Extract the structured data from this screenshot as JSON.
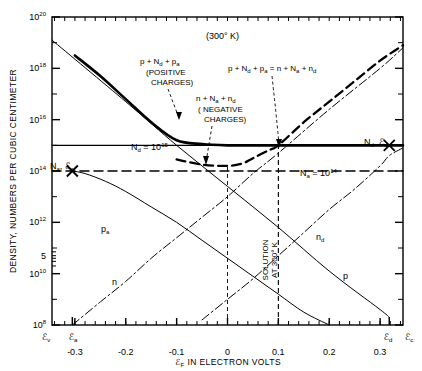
{
  "figure": {
    "temperature_label": "(300° K)",
    "y_axis_title": "DENSITY, NUMBERS PER CUBIC CENTIMETER",
    "x_axis_title_prefix": "ℰ",
    "x_axis_title_sub": "F",
    "x_axis_title_rest": " IN ELECTRON VOLTS"
  },
  "annotations": {
    "positive": {
      "line1": "p + N",
      "line1_sub": "d",
      "line1_rest": " + p",
      "line1_sub2": "a",
      "line2": "(POSITIVE",
      "line3": "CHARGES)"
    },
    "negative": {
      "line1": "n + N",
      "line1_sub": "a",
      "line1_rest": " + n",
      "line1_sub2": "d",
      "line2": "( NEGATIVE",
      "line3": "CHARGES)"
    },
    "balance_equation": "p + Nₙ + pₐ = n + Nₐ + nₑ",
    "solution_line1": "SOLUTION",
    "solution_line2": "AT 300° K",
    "nd_level_label": "N",
    "nd_level_sub": "d",
    "nd_level_value": " = 10",
    "nd_level_exp": "15",
    "na_level_label": "N",
    "na_level_sub": "a",
    "na_level_value": " = 10",
    "na_level_exp": "14",
    "na_marker": "N",
    "na_marker_sub": "a",
    "na_marker_rest": ", ℰ",
    "na_marker_sub2": "a",
    "nd_marker": "N",
    "nd_marker_sub": "d",
    "nd_marker_rest": ", ℰ",
    "nd_marker_sub2": "d"
  },
  "curve_labels": {
    "pa": "p",
    "pa_sub": "a",
    "n": "n",
    "nd": "n",
    "nd_sub": "d",
    "p": "p"
  },
  "band_edges": {
    "ev": "ℰ",
    "ev_sub": "v",
    "ea": "ℰ",
    "ea_sub": "a",
    "ed": "ℰ",
    "ed_sub": "d",
    "ec": "ℰ",
    "ec_sub": "c"
  },
  "chart_data": {
    "type": "line",
    "title": "(300° K)",
    "xlabel": "ℰF IN ELECTRON VOLTS",
    "ylabel": "DENSITY, NUMBERS PER CUBIC CENTIMETER",
    "xlim": [
      -0.345,
      0.345
    ],
    "ylim_log10": [
      8,
      20
    ],
    "grid": false,
    "legend": "inline-curve-labels",
    "x_ticks": [
      -0.3,
      -0.2,
      -0.1,
      0,
      0.1,
      0.2,
      0.3
    ],
    "x_tick_labels": [
      "-0.3",
      "-0.2",
      "-0.1",
      "0",
      "0.1",
      "0.2",
      "0.3"
    ],
    "x_minor_step": 0.02,
    "y_ticks_log10": [
      8,
      10,
      12,
      14,
      16,
      18,
      20
    ],
    "y_tick_labels": [
      "10",
      "10",
      "10",
      "10",
      "10",
      "10",
      "10"
    ],
    "y_tick_exponents": [
      "8",
      "10",
      "12",
      "14",
      "16",
      "18",
      "20"
    ],
    "y_extra_tick_label": "5",
    "y_extra_tick_log10": 10.7,
    "band_edge_positions": {
      "ev": -0.345,
      "ea": -0.305,
      "ed": 0.318,
      "ec": 0.345
    },
    "markers": [
      {
        "name": "Na,Ea",
        "x": -0.305,
        "y_log10": 14.0,
        "symbol": "X"
      },
      {
        "name": "Nd,Ed",
        "x": 0.318,
        "y_log10": 15.0,
        "symbol": "X"
      }
    ],
    "solution_x": 0.1,
    "solution_y_log10": 15.0,
    "series": [
      {
        "name": "Nd = 1e15",
        "style": "solid-thin-horizontal",
        "y_log10": 15.0,
        "x": [
          -0.345,
          0.345
        ],
        "values_log10": [
          15.0,
          15.0
        ]
      },
      {
        "name": "Na = 1e14",
        "style": "dashed-horizontal",
        "y_log10": 14.0,
        "x": [
          -0.345,
          0.345
        ],
        "values_log10": [
          14.0,
          14.0
        ]
      },
      {
        "name": "p",
        "style": "solid-thin",
        "x": [
          -0.345,
          -0.2,
          -0.1,
          0,
          0.1,
          0.2,
          0.3,
          0.318
        ],
        "values_log10": [
          19.1,
          16.7,
          15.0,
          13.4,
          11.8,
          10.1,
          8.6,
          8.3
        ]
      },
      {
        "name": "p_a",
        "style": "solid-thin",
        "x": [
          -0.305,
          -0.28,
          -0.24,
          -0.2,
          -0.15,
          -0.1,
          -0.05,
          0,
          0.05,
          0.1,
          0.15,
          0.2
        ],
        "values_log10": [
          14.0,
          13.9,
          13.6,
          13.2,
          12.6,
          12.0,
          11.3,
          10.6,
          9.9,
          9.2,
          8.5,
          8.0
        ]
      },
      {
        "name": "n",
        "style": "dash-dot",
        "x": [
          -0.305,
          -0.25,
          -0.2,
          -0.15,
          -0.1,
          -0.05,
          0,
          0.05,
          0.1,
          0.2,
          0.3,
          0.345
        ],
        "values_log10": [
          8.0,
          8.9,
          9.7,
          10.6,
          11.4,
          12.2,
          13.0,
          13.9,
          14.7,
          16.4,
          18.0,
          18.8
        ]
      },
      {
        "name": "n_d",
        "style": "dash-dot",
        "x": [
          -0.05,
          0,
          0.05,
          0.1,
          0.15,
          0.2,
          0.25,
          0.3,
          0.318,
          0.345
        ],
        "values_log10": [
          8.2,
          9.0,
          9.8,
          10.7,
          11.6,
          12.5,
          13.3,
          14.2,
          14.6,
          14.9
        ]
      },
      {
        "name": "positive-charges-sum",
        "style": "solid-thick",
        "x": [
          -0.3,
          -0.25,
          -0.2,
          -0.15,
          -0.1,
          -0.05,
          0,
          0.05,
          0.08,
          0.1,
          0.15,
          0.2,
          0.25,
          0.3,
          0.345
        ],
        "values_log10": [
          18.5,
          17.7,
          16.8,
          15.9,
          15.2,
          15.05,
          15.0,
          15.0,
          15.0,
          15.0,
          15.0,
          15.0,
          15.0,
          15.0,
          15.0
        ]
      },
      {
        "name": "negative-charges-sum",
        "style": "dashed-thick",
        "x": [
          -0.1,
          -0.05,
          0,
          0.03,
          0.05,
          0.08,
          0.1,
          0.15,
          0.2,
          0.25,
          0.3,
          0.345
        ],
        "values_log10": [
          14.45,
          14.25,
          14.2,
          14.3,
          14.5,
          14.8,
          15.0,
          15.9,
          16.7,
          17.5,
          18.3,
          18.9
        ]
      }
    ]
  }
}
